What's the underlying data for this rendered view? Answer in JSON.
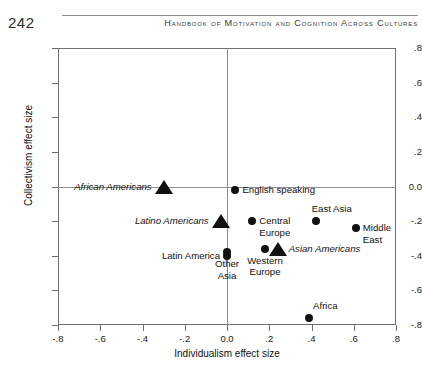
{
  "page": {
    "number": "242",
    "running_head": "Handbook of Motivation and Cognition Across Cultures"
  },
  "chart_data": {
    "type": "scatter",
    "title": "",
    "xlabel": "Individualism effect size",
    "ylabel": "Collectivism effect size",
    "xlim": [
      -0.8,
      0.8
    ],
    "ylim": [
      -0.8,
      0.8
    ],
    "xticks": [
      "-.8",
      "-.6",
      "-.4",
      "-.2",
      "0.0",
      ".2",
      ".4",
      ".6",
      ".8"
    ],
    "xtick_values": [
      -0.8,
      -0.6,
      -0.4,
      -0.2,
      0.0,
      0.2,
      0.4,
      0.6,
      0.8
    ],
    "yticks": [
      ".8",
      ".6",
      ".4",
      ".2",
      "0.0",
      "-.2",
      "-.4",
      "-.6",
      "-.8"
    ],
    "ytick_values": [
      0.8,
      0.6,
      0.4,
      0.2,
      0.0,
      -0.2,
      -0.4,
      -0.6,
      -0.8
    ],
    "grid": false,
    "zero_lines": true,
    "legend": "none",
    "series": [
      {
        "name": "Cultural regions",
        "marker": "circle",
        "points": [
          {
            "label": "English speaking",
            "x": 0.04,
            "y": -0.02,
            "label_pos": "right"
          },
          {
            "label": "Central\nEurope",
            "x": 0.12,
            "y": -0.2,
            "label_pos": "right"
          },
          {
            "label": "East Asia",
            "x": 0.42,
            "y": -0.2,
            "label_pos": "above"
          },
          {
            "label": "Middle\nEast",
            "x": 0.61,
            "y": -0.24,
            "label_pos": "right"
          },
          {
            "label": "Western\nEurope",
            "x": 0.18,
            "y": -0.36,
            "label_pos": "below"
          },
          {
            "label": "Other\nAsia",
            "x": 0.0,
            "y": -0.38,
            "label_pos": "below"
          },
          {
            "label": "Latin America",
            "x": 0.0,
            "y": -0.4,
            "label_pos": "left"
          },
          {
            "label": "Africa",
            "x": 0.39,
            "y": -0.76,
            "label_pos": "above"
          }
        ]
      },
      {
        "name": "U.S. ethnic groups",
        "marker": "triangle",
        "points": [
          {
            "label": "African Americans",
            "x": -0.3,
            "y": 0.0,
            "label_pos": "left"
          },
          {
            "label": "Latino Americans",
            "x": -0.03,
            "y": -0.2,
            "label_pos": "left"
          },
          {
            "label": "Asian Americans",
            "x": 0.24,
            "y": -0.36,
            "label_pos": "right"
          }
        ]
      }
    ]
  }
}
